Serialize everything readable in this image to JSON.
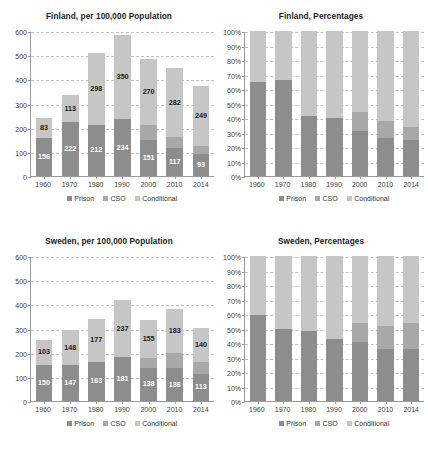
{
  "page": {
    "cut_off_header": "",
    "background": "#ffffff"
  },
  "colors": {
    "prison": "#8d8d8d",
    "cso": "#a8a8a8",
    "conditional": "#c6c6c6",
    "axis": "#9a9a9a",
    "grid": "#c2c2c2",
    "label_dark": "#1a1a1a",
    "label_light": "#ffffff"
  },
  "legend": {
    "items": [
      {
        "label": "Prison",
        "color": "#8d8d8d",
        "icon": "legend-swatch-icon"
      },
      {
        "label": "CSO",
        "color": "#a8a8a8",
        "icon": "legend-swatch-icon"
      },
      {
        "label": "Conditional",
        "color": "#c6c6c6",
        "icon": "legend-swatch-icon"
      }
    ]
  },
  "chart_data": [
    {
      "id": "finland-counts",
      "type": "bar",
      "stacked": true,
      "title": "Finland, per 100,000 Population",
      "xlabel": "",
      "ylabel": "",
      "ylim": [
        0,
        600
      ],
      "yticks": [
        0,
        100,
        200,
        300,
        400,
        500,
        600
      ],
      "ytick_labels": [
        "0",
        "100",
        "200",
        "300",
        "400",
        "500",
        "600"
      ],
      "grid": true,
      "legend_position": "bottom",
      "categories": [
        "1960",
        "1970",
        "1980",
        "1990",
        "2000",
        "2010",
        "2014"
      ],
      "series": [
        {
          "name": "Prison",
          "color": "#8d8d8d",
          "values": [
            156,
            222,
            212,
            234,
            151,
            117,
            93
          ],
          "labels": [
            "156",
            "222",
            "212",
            "234",
            "151",
            "117",
            "93"
          ],
          "label_color": "#ffffff"
        },
        {
          "name": "CSO",
          "color": "#a8a8a8",
          "values": [
            0,
            0,
            0,
            0,
            62,
            46,
            31
          ],
          "labels": [
            "",
            "",
            "",
            "",
            "",
            "",
            ""
          ],
          "label_color": "#1a1a1a"
        },
        {
          "name": "Conditional",
          "color": "#c6c6c6",
          "values": [
            83,
            113,
            298,
            350,
            270,
            282,
            249
          ],
          "labels": [
            "83",
            "113",
            "298",
            "350",
            "270",
            "282",
            "249"
          ],
          "label_color": "#1a1a1a"
        }
      ],
      "totals": [
        239,
        335,
        510,
        584,
        483,
        445,
        373
      ]
    },
    {
      "id": "finland-percentages",
      "type": "bar",
      "stacked": true,
      "title": "Finland, Percentages",
      "xlabel": "",
      "ylabel": "",
      "ylim": [
        0,
        100
      ],
      "yticks": [
        0,
        10,
        20,
        30,
        40,
        50,
        60,
        70,
        80,
        90,
        100
      ],
      "ytick_labels": [
        "0%",
        "10%",
        "20%",
        "30%",
        "40%",
        "50%",
        "60%",
        "70%",
        "80%",
        "90%",
        "100%"
      ],
      "grid": true,
      "legend_position": "bottom",
      "categories": [
        "1960",
        "1970",
        "1980",
        "1990",
        "2000",
        "2010",
        "2014"
      ],
      "series": [
        {
          "name": "Prison",
          "color": "#8d8d8d",
          "values": [
            65,
            66,
            41.5,
            40,
            31,
            26,
            25
          ],
          "labels": [
            "",
            "",
            "",
            "",
            "",
            "",
            ""
          ],
          "label_color": "#ffffff"
        },
        {
          "name": "CSO",
          "color": "#a8a8a8",
          "values": [
            0,
            0,
            0,
            0,
            13,
            12,
            9
          ],
          "labels": [
            "",
            "",
            "",
            "",
            "",
            "",
            ""
          ],
          "label_color": "#1a1a1a"
        },
        {
          "name": "Conditional",
          "color": "#c6c6c6",
          "values": [
            35,
            34,
            58.5,
            60,
            56,
            62,
            66
          ],
          "labels": [
            "",
            "",
            "",
            "",
            "",
            "",
            ""
          ],
          "label_color": "#1a1a1a"
        }
      ],
      "totals": [
        100,
        100,
        100,
        100,
        100,
        100,
        100
      ]
    },
    {
      "id": "sweden-counts",
      "type": "bar",
      "stacked": true,
      "title": "Sweden, per 100,000 Population",
      "xlabel": "",
      "ylabel": "",
      "ylim": [
        0,
        600
      ],
      "yticks": [
        0,
        100,
        200,
        300,
        400,
        500,
        600
      ],
      "ytick_labels": [
        "0",
        "100",
        "200",
        "300",
        "400",
        "500",
        "600"
      ],
      "grid": true,
      "legend_position": "bottom",
      "categories": [
        "1960",
        "1970",
        "1980",
        "1990",
        "2000",
        "2010",
        "2014"
      ],
      "series": [
        {
          "name": "Prison",
          "color": "#8d8d8d",
          "values": [
            150,
            147,
            163,
            181,
            138,
            136,
            113
          ],
          "labels": [
            "150",
            "147",
            "163",
            "181",
            "138",
            "136",
            "113"
          ],
          "label_color": "#ffffff"
        },
        {
          "name": "CSO",
          "color": "#a8a8a8",
          "values": [
            0,
            0,
            0,
            0,
            41,
            62,
            49
          ],
          "labels": [
            "",
            "",
            "",
            "",
            "",
            "",
            ""
          ],
          "label_color": "#1a1a1a"
        },
        {
          "name": "Conditional",
          "color": "#c6c6c6",
          "values": [
            103,
            148,
            177,
            237,
            155,
            183,
            140
          ],
          "labels": [
            "103",
            "148",
            "177",
            "237",
            "155",
            "183",
            "140"
          ],
          "label_color": "#1a1a1a"
        }
      ],
      "totals": [
        253,
        295,
        340,
        418,
        334,
        381,
        302
      ]
    },
    {
      "id": "sweden-percentages",
      "type": "bar",
      "stacked": true,
      "title": "Sweden, Percentages",
      "xlabel": "",
      "ylabel": "",
      "ylim": [
        0,
        100
      ],
      "yticks": [
        0,
        10,
        20,
        30,
        40,
        50,
        60,
        70,
        80,
        90,
        100
      ],
      "ytick_labels": [
        "0%",
        "10%",
        "20%",
        "30%",
        "40%",
        "50%",
        "60%",
        "70%",
        "80%",
        "90%",
        "100%"
      ],
      "grid": true,
      "legend_position": "bottom",
      "categories": [
        "1960",
        "1970",
        "1980",
        "1990",
        "2000",
        "2010",
        "2014"
      ],
      "series": [
        {
          "name": "Prison",
          "color": "#8d8d8d",
          "values": [
            59,
            50,
            48,
            43,
            41,
            36,
            36
          ],
          "labels": [
            "",
            "",
            "",
            "",
            "",
            "",
            ""
          ],
          "label_color": "#ffffff"
        },
        {
          "name": "CSO",
          "color": "#a8a8a8",
          "values": [
            0,
            0,
            0,
            0,
            13,
            16,
            18
          ],
          "labels": [
            "",
            "",
            "",
            "",
            "",
            "",
            ""
          ],
          "label_color": "#1a1a1a"
        },
        {
          "name": "Conditional",
          "color": "#c6c6c6",
          "values": [
            41,
            50,
            52,
            57,
            46,
            48,
            46
          ],
          "labels": [
            "",
            "",
            "",
            "",
            "",
            "",
            ""
          ],
          "label_color": "#1a1a1a"
        }
      ],
      "totals": [
        100,
        100,
        100,
        100,
        100,
        100,
        100
      ]
    }
  ]
}
